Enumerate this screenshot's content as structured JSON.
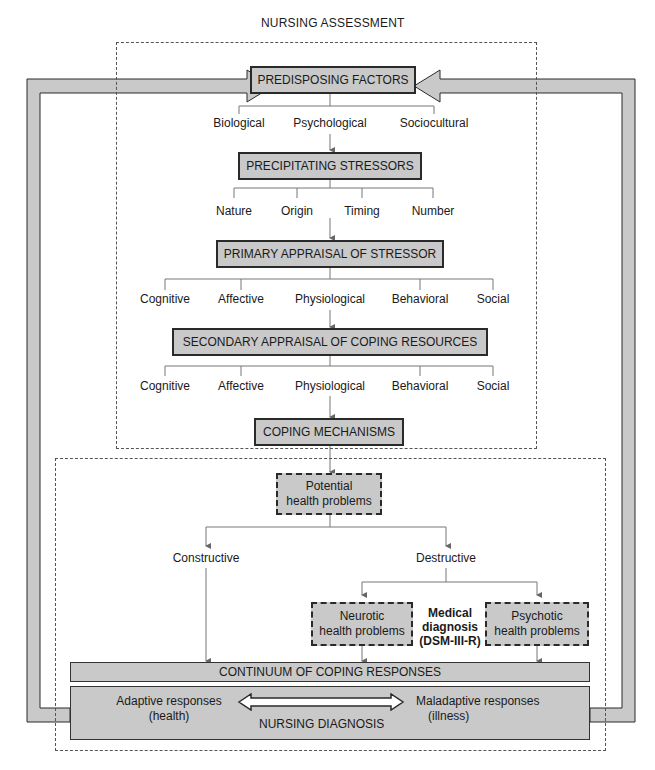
{
  "section_titles": {
    "assessment": "NURSING ASSESSMENT",
    "diagnosis": "NURSING DIAGNOSIS"
  },
  "nodes": {
    "predisposing": "PREDISPOSING FACTORS",
    "precipitating": "PRECIPITATING STRESSORS",
    "primary": "PRIMARY APPRAISAL OF STRESSOR",
    "secondary": "SECONDARY APPRAISAL OF COPING RESOURCES",
    "coping": "COPING MECHANISMS",
    "potential_line1": "Potential",
    "potential_line2": "health problems",
    "neurotic_line1": "Neurotic",
    "neurotic_line2": "health problems",
    "psychotic_line1": "Psychotic",
    "psychotic_line2": "health problems",
    "continuum": "CONTINUUM OF COPING RESPONSES"
  },
  "predisposing_children": [
    "Biological",
    "Psychological",
    "Sociocultural"
  ],
  "precipitating_children": [
    "Nature",
    "Origin",
    "Timing",
    "Number"
  ],
  "primary_children": [
    "Cognitive",
    "Affective",
    "Physiological",
    "Behavioral",
    "Social"
  ],
  "secondary_children": [
    "Cognitive",
    "Affective",
    "Physiological",
    "Behavioral",
    "Social"
  ],
  "branches": {
    "constructive": "Constructive",
    "destructive": "Destructive"
  },
  "medical": {
    "line1": "Medical",
    "line2": "diagnosis",
    "line3": "(DSM-III-R)"
  },
  "responses": {
    "adaptive_line1": "Adaptive responses",
    "adaptive_line2": "(health)",
    "maladaptive_line1": "Maladaptive responses",
    "maladaptive_line2": "(illness)"
  },
  "colors": {
    "box_fill": "#c9c9c9",
    "stroke": "#2a2a2a",
    "connector": "#666666"
  }
}
